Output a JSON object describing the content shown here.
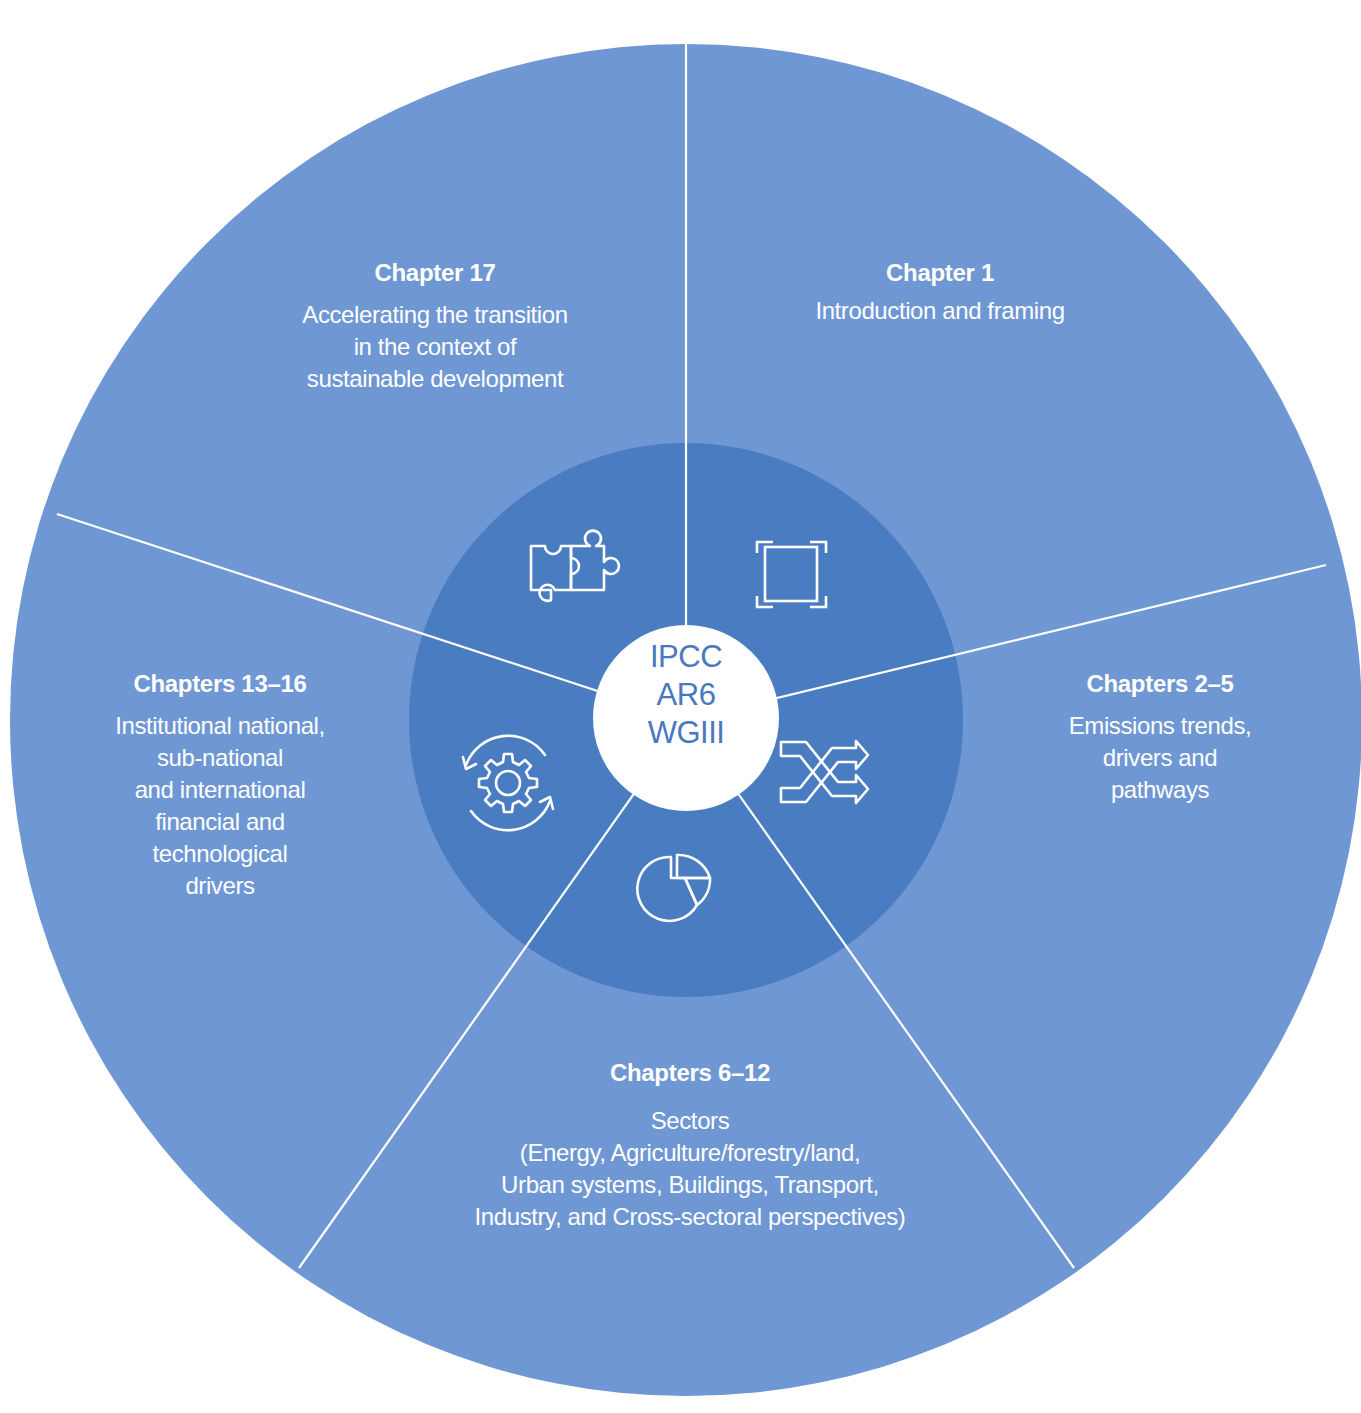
{
  "diagram": {
    "type": "segmented-circle",
    "colors": {
      "outer_ring": "#6e97d3",
      "inner_ring": "#4a7cc2",
      "center": "#ffffff",
      "center_text": "#4a78bf",
      "divider": "#ffffff",
      "label_text": "#ffffff"
    },
    "center": {
      "line1": "IPCC",
      "line2": "AR6",
      "line3": "WGIII"
    },
    "segments": [
      {
        "id": "chapter-1",
        "title": "Chapter 1",
        "description": "Introduction and framing",
        "icon": "frame-icon"
      },
      {
        "id": "chapters-2-5",
        "title": "Chapters 2–5",
        "description": "Emissions trends,\ndrivers and\npathways",
        "icon": "shuffle-arrows-icon"
      },
      {
        "id": "chapters-6-12",
        "title": "Chapters 6–12",
        "description": "Sectors\n(Energy, Agriculture/forestry/land,\nUrban systems, Buildings, Transport,\nIndustry, and Cross-sectoral perspectives)",
        "icon": "pie-chart-icon"
      },
      {
        "id": "chapters-13-16",
        "title": "Chapters 13–16",
        "description": "Institutional national,\nsub-national\nand international\nfinancial and\ntechnological\ndrivers",
        "icon": "gear-cycle-icon"
      },
      {
        "id": "chapter-17",
        "title": "Chapter 17",
        "description": "Accelerating the transition\nin the context of\nsustainable development",
        "icon": "puzzle-icon"
      }
    ]
  }
}
